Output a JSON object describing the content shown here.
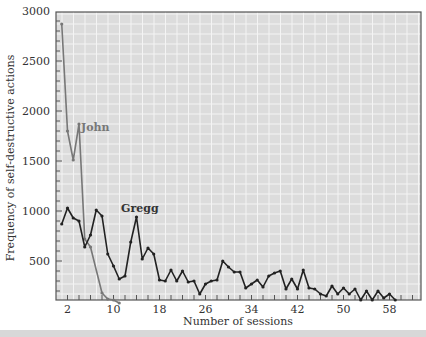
{
  "chart_data": {
    "type": "line",
    "title": "",
    "xlabel": "Number of sessions",
    "ylabel": "Frequency of self-destructive actions",
    "xlim": [
      0,
      64
    ],
    "ylim": [
      100,
      3050
    ],
    "x_ticks": [
      2,
      10,
      18,
      26,
      34,
      42,
      50,
      58
    ],
    "y_ticks": [
      500,
      1000,
      1500,
      2000,
      2500,
      3000
    ],
    "grid": true,
    "legend": "inline labels",
    "series": [
      {
        "name": "John",
        "color": "#777777",
        "x": [
          1,
          2,
          3,
          4,
          5,
          6,
          8,
          9,
          10,
          11
        ],
        "values": [
          2870,
          1800,
          1510,
          1870,
          720,
          640,
          180,
          120,
          110,
          80
        ]
      },
      {
        "name": "Gregg",
        "color": "#222222",
        "x": [
          1,
          2,
          3,
          4,
          5,
          6,
          7,
          8,
          9,
          10,
          11,
          12,
          13,
          14,
          15,
          16,
          17,
          18,
          19,
          20,
          21,
          22,
          23,
          24,
          25,
          26,
          27,
          28,
          29,
          30,
          31,
          32,
          33,
          34,
          35,
          36,
          37,
          38,
          39,
          40,
          41,
          42,
          43,
          44,
          45,
          46,
          47,
          48,
          49,
          50,
          51,
          52,
          53,
          54,
          55,
          56,
          57,
          58,
          59
        ],
        "values": [
          870,
          1030,
          930,
          900,
          640,
          760,
          1010,
          950,
          570,
          450,
          320,
          350,
          690,
          940,
          520,
          630,
          570,
          310,
          300,
          410,
          300,
          400,
          290,
          300,
          170,
          270,
          300,
          310,
          500,
          440,
          390,
          390,
          230,
          270,
          310,
          240,
          350,
          380,
          400,
          220,
          320,
          220,
          410,
          230,
          220,
          170,
          150,
          250,
          170,
          230,
          170,
          220,
          110,
          200,
          110,
          200,
          130,
          170,
          110
        ]
      }
    ]
  },
  "labels": {
    "xlabel": "Number of sessions",
    "ylabel": "Frequency of self-destructive actions",
    "john": "John",
    "gregg": "Gregg"
  }
}
